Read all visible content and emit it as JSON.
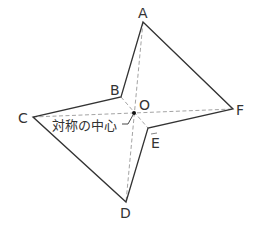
{
  "figure": {
    "points": {
      "A": {
        "label": "A",
        "x": 143,
        "y": 22
      },
      "B": {
        "label": "B",
        "x": 121,
        "y": 97
      },
      "C": {
        "label": "C",
        "x": 33,
        "y": 117
      },
      "D": {
        "label": "D",
        "x": 126,
        "y": 202
      },
      "E": {
        "label": "E",
        "x": 148,
        "y": 128
      },
      "F": {
        "label": "F",
        "x": 233,
        "y": 109
      },
      "O": {
        "label": "O",
        "x": 134,
        "y": 113
      }
    },
    "center_annotation": "対称の中心",
    "colors": {
      "outline": "#333333",
      "dashed": "#999999",
      "text": "#333333"
    }
  }
}
